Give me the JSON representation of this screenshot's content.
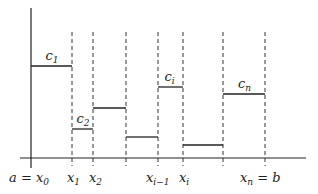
{
  "diagram": {
    "type": "step-function-partition",
    "axis_color": "#222222",
    "steps": [
      {
        "x0": 31,
        "x1": 72,
        "y": 66,
        "label": "c",
        "sub": "1"
      },
      {
        "x0": 72,
        "x1": 93,
        "y": 129,
        "label": "c",
        "sub": "2"
      },
      {
        "x0": 93,
        "x1": 126,
        "y": 108,
        "label": "",
        "sub": ""
      },
      {
        "x0": 126,
        "x1": 158,
        "y": 137,
        "label": "",
        "sub": ""
      },
      {
        "x0": 158,
        "x1": 183,
        "y": 87,
        "label": "c",
        "sub": "i"
      },
      {
        "x0": 183,
        "x1": 223,
        "y": 145,
        "label": "",
        "sub": ""
      },
      {
        "x0": 223,
        "x1": 265,
        "y": 94,
        "label": "c",
        "sub": "n"
      }
    ],
    "dashed_x": [
      72,
      93,
      126,
      158,
      183,
      223,
      265
    ],
    "x_labels": [
      {
        "text": "a = x",
        "sub": "0",
        "x": 9
      },
      {
        "text": "x",
        "sub": "1",
        "x": 67
      },
      {
        "text": "x",
        "sub": "2",
        "x": 89
      },
      {
        "text": "x",
        "sub": "i−1",
        "x": 146
      },
      {
        "text": "x",
        "sub": "i",
        "x": 179
      },
      {
        "text": "x",
        "sub": "n",
        "tail": " = b",
        "x": 240
      }
    ]
  }
}
